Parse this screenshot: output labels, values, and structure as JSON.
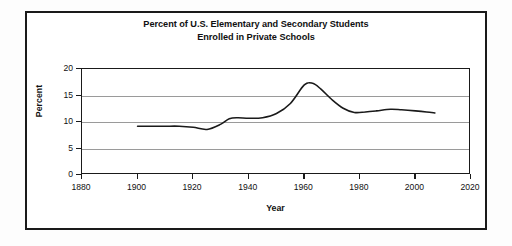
{
  "chart_data": {
    "type": "line",
    "title": "Percent of U.S. Elementary and Secondary Students Enrolled in Private Schools",
    "title_line1": "Percent of U.S. Elementary and Secondary Students",
    "title_line2": "Enrolled in Private Schools",
    "xlabel": "Year",
    "ylabel": "Percent",
    "xlim": [
      1880,
      2020
    ],
    "ylim": [
      0,
      20
    ],
    "xticks": [
      1880,
      1900,
      1920,
      1940,
      1960,
      1980,
      2000,
      2020
    ],
    "xticklabels": [
      "1880",
      "1900",
      "1920",
      "1940",
      "1960",
      "1980",
      "2000",
      "2020"
    ],
    "yticks": [
      0,
      5,
      10,
      15,
      20
    ],
    "yticklabels": [
      "0",
      "5",
      "10",
      "15",
      "20"
    ],
    "grid": "horizontal",
    "legend": null,
    "line_color": "#1a1a1a",
    "grid_color": "#9a9a9a",
    "series": [
      {
        "name": "Percent enrolled in private schools",
        "x": [
          1900,
          1905,
          1910,
          1915,
          1920,
          1925,
          1930,
          1933,
          1936,
          1940,
          1945,
          1950,
          1955,
          1960,
          1963,
          1966,
          1970,
          1974,
          1978,
          1982,
          1986,
          1991,
          1995,
          2000,
          2004,
          2007
        ],
        "values": [
          9.2,
          9.2,
          9.2,
          9.2,
          9.0,
          8.6,
          9.6,
          10.6,
          10.8,
          10.7,
          10.8,
          11.6,
          13.5,
          17.0,
          17.3,
          16.2,
          14.2,
          12.6,
          11.8,
          11.9,
          12.1,
          12.4,
          12.3,
          12.1,
          11.9,
          11.7
        ]
      }
    ],
    "notable_points": {
      "start": {
        "year": 1900,
        "value": 9.2
      },
      "minimum": {
        "year": 1925,
        "value": 8.6
      },
      "maximum": {
        "year": 1963,
        "value": 17.3
      },
      "end": {
        "year": 2007,
        "value": 11.7
      }
    }
  }
}
